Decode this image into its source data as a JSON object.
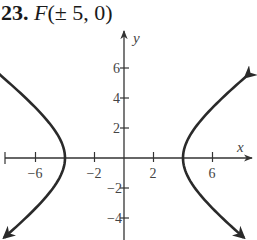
{
  "problem": {
    "number": "23.",
    "label": "F",
    "value": "(± 5, 0)"
  },
  "chart_data": {
    "type": "line",
    "xlabel": "x",
    "ylabel": "y",
    "x_ticks": [
      -6,
      -2,
      2,
      6
    ],
    "y_ticks": [
      6,
      4,
      2,
      -2,
      -4
    ],
    "x_tick_labels": [
      "−6",
      "−2",
      "2",
      "6"
    ],
    "y_tick_labels": [
      "6",
      "4",
      "2",
      "−2",
      "−4"
    ],
    "xlim": [
      -8,
      8.6
    ],
    "ylim": [
      -5.5,
      8.5
    ],
    "grid": false,
    "equation": "x^2/16 - y^2/9 = 1",
    "foci": [
      [
        -5,
        0
      ],
      [
        5,
        0
      ]
    ],
    "vertices": [
      [
        -4,
        0
      ],
      [
        4,
        0
      ]
    ],
    "series": [
      {
        "name": "right branch",
        "x": [
          8.24,
          6.67,
          4.81,
          4.0,
          4.81,
          6.67,
          8.1
        ],
        "y": [
          5.4,
          4,
          2,
          0,
          -2,
          -4,
          -5.3
        ]
      },
      {
        "name": "left branch",
        "x": [
          -8.24,
          -6.67,
          -4.81,
          -4.0,
          -4.81,
          -6.67,
          -8.1
        ],
        "y": [
          5.4,
          4,
          2,
          0,
          -2,
          -4,
          -5.3
        ]
      }
    ]
  }
}
